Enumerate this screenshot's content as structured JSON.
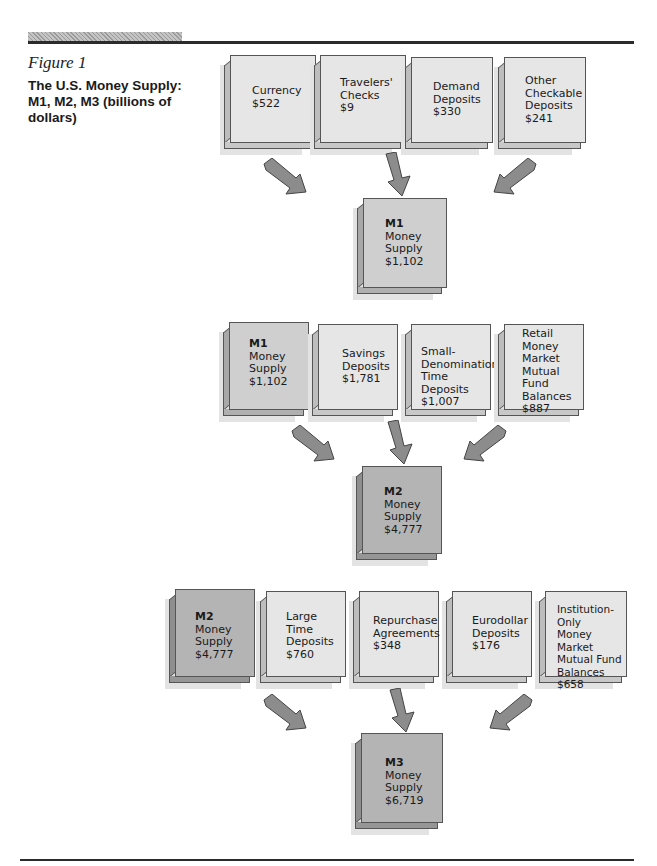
{
  "figure": {
    "label": "Figure 1",
    "title": "The U.S. Money Supply: M1, M2, M3 (billions of dollars)"
  },
  "m1_inputs": [
    {
      "lines": [
        "Currency",
        "$522"
      ]
    },
    {
      "lines": [
        "Travelers'",
        "Checks",
        "$9"
      ]
    },
    {
      "lines": [
        "Demand",
        "Deposits",
        "$330"
      ]
    },
    {
      "lines": [
        "Other",
        "Checkable",
        "Deposits",
        "$241"
      ]
    }
  ],
  "m1_total": {
    "name": "M1",
    "lines": [
      "Money",
      "Supply",
      "$1,102"
    ]
  },
  "m2_inputs": [
    {
      "name": "M1",
      "lines": [
        "Money",
        "Supply",
        "$1,102"
      ]
    },
    {
      "lines": [
        "Savings",
        "Deposits",
        "$1,781"
      ]
    },
    {
      "lines": [
        "Small-",
        "Denomination",
        "Time Deposits",
        "$1,007"
      ]
    },
    {
      "lines": [
        "Retail",
        "Money",
        "Market",
        "Mutual Fund",
        "Balances",
        "$887"
      ]
    }
  ],
  "m2_total": {
    "name": "M2",
    "lines": [
      "Money",
      "Supply",
      "$4,777"
    ]
  },
  "m3_inputs": [
    {
      "name": "M2",
      "lines": [
        "Money",
        "Supply",
        "$4,777"
      ]
    },
    {
      "lines": [
        "Large",
        "Time",
        "Deposits",
        "$760"
      ]
    },
    {
      "lines": [
        "Repurchase",
        "Agreements",
        "$348"
      ]
    },
    {
      "lines": [
        "Eurodollar",
        "Deposits",
        "$176"
      ]
    },
    {
      "lines": [
        "Institution-Only",
        "Money Market",
        "Mutual Fund",
        "Balances",
        "$658"
      ]
    }
  ],
  "m3_total": {
    "name": "M3",
    "lines": [
      "Money",
      "Supply",
      "$6,719"
    ]
  },
  "colors": {
    "light_box": "#e6e6e6",
    "m1_box": "#cfcfcf",
    "m2_m3_box": "#b4b4b4",
    "arrow": "#8c8c8c",
    "rule": "#2b2b2b"
  }
}
